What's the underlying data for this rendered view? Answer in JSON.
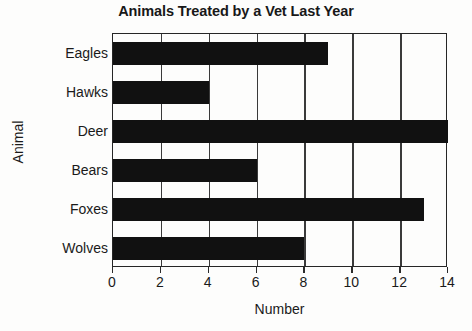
{
  "chart_data": {
    "type": "bar",
    "orientation": "horizontal",
    "title": "Animals Treated by a Vet Last Year",
    "xlabel": "Number",
    "ylabel": "Animal",
    "categories": [
      "Eagles",
      "Hawks",
      "Deer",
      "Bears",
      "Foxes",
      "Wolves"
    ],
    "values": [
      9,
      4,
      14,
      6,
      13,
      8
    ],
    "xlim": [
      0,
      14
    ],
    "xticks": [
      0,
      2,
      4,
      6,
      8,
      10,
      12,
      14
    ],
    "xtick_labels": [
      "0",
      "2",
      "4",
      "6",
      "8",
      "10",
      "12",
      "14"
    ],
    "grid": "vertical",
    "legend": "none",
    "bar_color": "#111111",
    "background_color": "#fdfdfc",
    "axis_color": "#262626"
  }
}
